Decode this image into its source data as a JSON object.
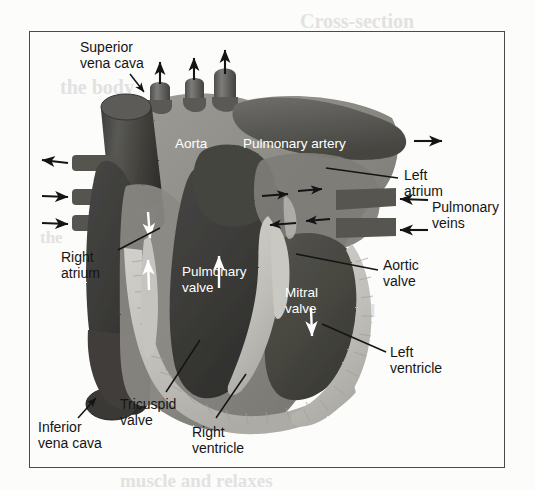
{
  "figure": {
    "type": "anatomical-diagram",
    "frame": {
      "x": 29,
      "y": 31,
      "width": 476,
      "height": 437,
      "border_color": "#4a4a4a"
    },
    "palette": {
      "page_background": "#fcfcfb",
      "myocardium_light": "#c9c7c2",
      "myocardium_mid": "#a7a5a0",
      "vessel_mid_gray": "#8b8a86",
      "vessel_dark_gray": "#6d6c69",
      "chamber_dark": "#4c4b49",
      "chamber_darkest": "#3a3937",
      "label_text": "#1b1b1b",
      "label_text_light": "#ffffff",
      "leader_line": "#1b1b1b",
      "bleed_text": "#e2e2e0"
    }
  },
  "labels": {
    "external": [
      {
        "id": "superior-vena-cava",
        "text_lines": [
          "Superior",
          "vena cava"
        ],
        "x": 80,
        "y": 40,
        "align": "left"
      },
      {
        "id": "right-atrium",
        "text_lines": [
          "Right",
          "atrium"
        ],
        "x": 61,
        "y": 250,
        "align": "left"
      },
      {
        "id": "inferior-vena-cava",
        "text_lines": [
          "Inferior",
          "vena cava"
        ],
        "x": 38,
        "y": 420,
        "align": "left"
      },
      {
        "id": "tricuspid-valve",
        "text_lines": [
          "Tricuspid",
          "valve"
        ],
        "x": 120,
        "y": 397,
        "align": "left"
      },
      {
        "id": "right-ventricle",
        "text_lines": [
          "Right",
          "ventricle"
        ],
        "x": 192,
        "y": 425,
        "align": "left"
      },
      {
        "id": "left-atrium",
        "text_lines": [
          "Left",
          "atrium"
        ],
        "x": 404,
        "y": 168,
        "align": "left"
      },
      {
        "id": "pulmonary-veins",
        "text_lines": [
          "Pulmonary",
          "veins"
        ],
        "x": 432,
        "y": 205,
        "align": "left"
      },
      {
        "id": "aortic-valve",
        "text_lines": [
          "Aortic",
          "valve"
        ],
        "x": 383,
        "y": 258,
        "align": "left"
      },
      {
        "id": "left-ventricle",
        "text_lines": [
          "Left",
          "ventricle"
        ],
        "x": 390,
        "y": 345,
        "align": "left"
      }
    ],
    "overlay": [
      {
        "id": "aorta",
        "text_lines": [
          "Aorta"
        ],
        "x": 175,
        "y": 143,
        "color": "#ffffff"
      },
      {
        "id": "pulmonary-artery",
        "text_lines": [
          "Pulmonary artery"
        ],
        "x": 243,
        "y": 143,
        "color": "#ffffff"
      },
      {
        "id": "pulmonary-valve",
        "text_lines": [
          "Pulmonary",
          "valve"
        ],
        "x": 182,
        "y": 270,
        "color": "#ffffff"
      },
      {
        "id": "mitral-valve",
        "text_lines": [
          "Mitral",
          "valve"
        ],
        "x": 285,
        "y": 291,
        "color": "#ffffff"
      }
    ]
  },
  "flow_arrows": {
    "description": "Black arrows outside the heart show blood entering and leaving; white arrows inside show flow through the chambers.",
    "external_black": [
      {
        "id": "arrow-aortic-branch-1",
        "direction": "up",
        "x": 160,
        "y": 72
      },
      {
        "id": "arrow-aortic-branch-2",
        "direction": "up",
        "x": 194,
        "y": 68
      },
      {
        "id": "arrow-aortic-branch-3",
        "direction": "up",
        "x": 224,
        "y": 62
      },
      {
        "id": "arrow-pulmonary-artery-out",
        "direction": "right",
        "x": 403,
        "y": 140
      },
      {
        "id": "arrow-left-vessel-out",
        "direction": "left",
        "x": 62,
        "y": 162
      },
      {
        "id": "arrow-left-vessel-in-1",
        "direction": "right",
        "x": 62,
        "y": 196
      },
      {
        "id": "arrow-left-vessel-in-2",
        "direction": "right",
        "x": 62,
        "y": 222
      },
      {
        "id": "arrow-pulmonary-vein-in-1",
        "direction": "left",
        "x": 400,
        "y": 202
      },
      {
        "id": "arrow-pulmonary-vein-in-2",
        "direction": "left",
        "x": 400,
        "y": 230
      }
    ],
    "internal_white": [
      {
        "id": "arrow-svc-into-right-atrium",
        "direction": "down",
        "x": 148,
        "y": 228
      },
      {
        "id": "arrow-right-atrium-up",
        "direction": "up",
        "x": 148,
        "y": 272
      },
      {
        "id": "arrow-into-pulmonary-valve",
        "direction": "up",
        "x": 219,
        "y": 268
      },
      {
        "id": "arrow-mitral-down",
        "direction": "down",
        "x": 311,
        "y": 325
      }
    ],
    "internal_black_left_atrium": [
      {
        "id": "arrow-la-1",
        "direction": "right",
        "x": 275,
        "y": 195
      },
      {
        "id": "arrow-la-2",
        "direction": "right",
        "x": 310,
        "y": 190
      },
      {
        "id": "arrow-la-3",
        "direction": "left",
        "x": 275,
        "y": 223
      },
      {
        "id": "arrow-la-4",
        "direction": "left",
        "x": 310,
        "y": 219
      }
    ]
  },
  "bleed_through_text": [
    {
      "text": "Cross-section",
      "x": 300,
      "y": 10,
      "size": 20
    },
    {
      "text": "the body",
      "x": 60,
      "y": 76,
      "size": 20
    },
    {
      "text": "chambers",
      "x": 300,
      "y": 128,
      "size": 18
    },
    {
      "text": "the",
      "x": 40,
      "y": 228,
      "size": 17
    },
    {
      "text": "blood",
      "x": 330,
      "y": 300,
      "size": 19
    },
    {
      "text": "muscle and relaxes",
      "x": 120,
      "y": 470,
      "size": 19
    }
  ]
}
